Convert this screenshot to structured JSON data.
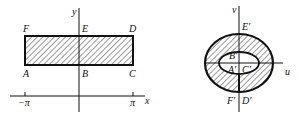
{
  "left_figure": {
    "axes": {
      "x_label": "x",
      "y_label": "y"
    },
    "ticks": {
      "neg_pi": "−π",
      "pi": "π"
    },
    "points": {
      "A": "A",
      "B": "B",
      "C": "C",
      "D": "D",
      "E": "E",
      "F": "F"
    }
  },
  "right_figure": {
    "axes": {
      "u_label": "u",
      "v_label": "v"
    },
    "points": {
      "A": "A′",
      "B": "B′",
      "C": "C′",
      "D": "D′",
      "E": "E′",
      "F": "F′"
    }
  },
  "colors": {
    "ink": "#111111",
    "background": "#ffffff"
  }
}
